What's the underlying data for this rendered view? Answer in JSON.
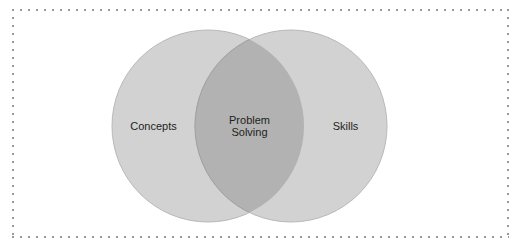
{
  "figure": {
    "type": "venn-diagram",
    "background_color": "#ffffff",
    "border": {
      "style": "dotted",
      "color": "#9a9a9a"
    },
    "colors": {
      "circle_fill": "#d2d2d2",
      "circle_stroke": "#b9b9b9",
      "overlap_fill": "#b2b2b2",
      "overlap_stroke": "#a0a0a0",
      "text": "#231f20"
    },
    "sets": [
      {
        "id": "left",
        "label": "Concepts",
        "cx": 208,
        "cy": 126,
        "r": 96
      },
      {
        "id": "right",
        "label": "Skills",
        "cx": 291,
        "cy": 126,
        "r": 96
      }
    ],
    "intersection": {
      "id": "overlap",
      "label": "Problem\nSolving",
      "label_line_1": "Problem",
      "label_line_2": "Solving"
    }
  }
}
